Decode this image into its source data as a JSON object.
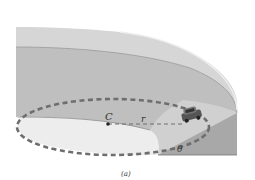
{
  "figure": {
    "caption": "(a)",
    "labels": {
      "center": "C",
      "radius": "r",
      "angle": "θ"
    },
    "colors": {
      "background": "#ffffff",
      "rim": "#d4d4d4",
      "banked_surface": "#bdbdbd",
      "inner_floor": "#ececec",
      "wedge": "#a9a9a9",
      "path_dash": "#6e6e6e",
      "edge_line": "#8a8a8a"
    }
  }
}
